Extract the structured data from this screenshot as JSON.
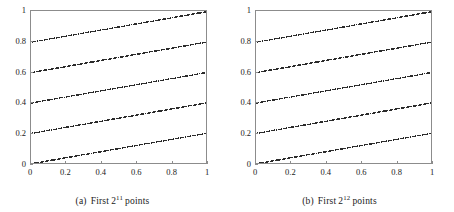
{
  "figure": {
    "panels": [
      {
        "id": "a",
        "tag": "(a)",
        "caption_prefix": "First",
        "caption_base": "2",
        "caption_exponent": "11",
        "caption_suffix": "points",
        "caption_full": "(a) First 2^11 points",
        "point_count": 2048,
        "dot_color": "#2b2b2b",
        "frame_color": "#8c8c8c"
      },
      {
        "id": "b",
        "tag": "(b)",
        "caption_prefix": "First",
        "caption_base": "2",
        "caption_exponent": "12",
        "caption_suffix": "points",
        "caption_full": "(b) First 2^12 points",
        "point_count": 4096,
        "dot_color": "#2b2b2b",
        "frame_color": "#8c8c8c"
      }
    ]
  },
  "chart_data": [
    {
      "type": "scatter",
      "title": "(a) First 2^11 points",
      "xlabel": "",
      "ylabel": "",
      "xlim": [
        0,
        1
      ],
      "ylim": [
        0,
        1
      ],
      "xticks": [
        0,
        0.2,
        0.4,
        0.6,
        0.8,
        1
      ],
      "yticks": [
        0,
        0.2,
        0.4,
        0.6,
        0.8,
        1
      ],
      "xticklabels": [
        "0",
        "0.2",
        "0.4",
        "0.6",
        "0.8",
        "1"
      ],
      "yticklabels": [
        "0",
        "0.2",
        "0.4",
        "0.6",
        "0.8",
        "1"
      ],
      "grid": false,
      "legend": false,
      "n_points": 2048,
      "marker": "dot",
      "marker_size": 0.7,
      "color": "#2b2b2b",
      "description": "Low-discrepancy lattice sequence; points form repeating diagonal bands rising left to right, about five band repetitions across the unit square.",
      "generator": {
        "kind": "weyl-lattice",
        "x_increment": 0.2441406,
        "y_increment": 0.0488281,
        "band_slope": 1.0,
        "band_period_x": 0.2
      }
    },
    {
      "type": "scatter",
      "title": "(b) First 2^12 points",
      "xlabel": "",
      "ylabel": "",
      "xlim": [
        0,
        1
      ],
      "ylim": [
        0,
        1
      ],
      "xticks": [
        0,
        0.2,
        0.4,
        0.6,
        0.8,
        1
      ],
      "yticks": [
        0,
        0.2,
        0.4,
        0.6,
        0.8,
        1
      ],
      "xticklabels": [
        "0",
        "0.2",
        "0.4",
        "0.6",
        "0.8",
        "1"
      ],
      "yticklabels": [
        "0",
        "0.2",
        "0.4",
        "0.6",
        "0.8",
        "1"
      ],
      "grid": false,
      "legend": false,
      "n_points": 4096,
      "marker": "dot",
      "marker_size": 0.7,
      "color": "#2b2b2b",
      "description": "Same lattice sequence at double the sample count; the diagonal bands are twice as dense while band spacing is unchanged.",
      "generator": {
        "kind": "weyl-lattice",
        "x_increment": 0.2441406,
        "y_increment": 0.0488281,
        "band_slope": 1.0,
        "band_period_x": 0.2
      }
    }
  ]
}
